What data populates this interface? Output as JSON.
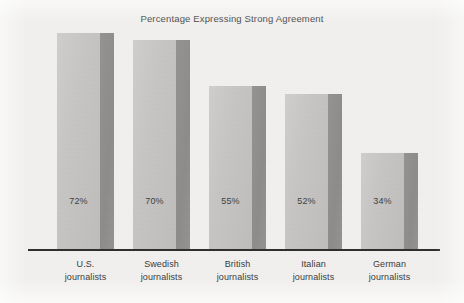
{
  "chart_data": {
    "type": "bar",
    "title": "Percentage Expressing Strong Agreement",
    "xlabel": "",
    "ylabel": "",
    "ylim": [
      0,
      80
    ],
    "grid": false,
    "legend": "none",
    "unit": "%",
    "categories": [
      "U.S. journalists",
      "Swedish journalists",
      "British journalists",
      "Italian journalists",
      "German journalists"
    ],
    "category_lines": [
      [
        "U.S.",
        "journalists"
      ],
      [
        "Swedish",
        "journalists"
      ],
      [
        "British",
        "journalists"
      ],
      [
        "Italian",
        "journalists"
      ],
      [
        "German",
        "journalists"
      ]
    ],
    "values": [
      72,
      70,
      55,
      52,
      34
    ],
    "value_labels": [
      "72%",
      "70%",
      "55%",
      "52%",
      "34%"
    ],
    "colors": {
      "bar_face": "#c6c5c3",
      "bar_side": "#8d8c8b",
      "axis": "#2e2e2e",
      "background": "#f1f0ee",
      "title_text": "#4a4a4a",
      "label_text": "#3a3a3a"
    }
  }
}
